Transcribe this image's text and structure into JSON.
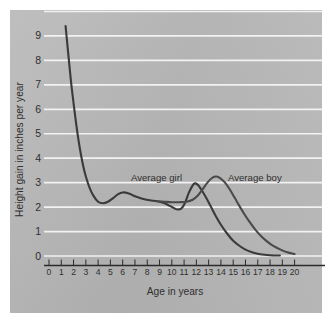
{
  "chart_data": {
    "type": "line",
    "title": "",
    "xlabel": "Age in years",
    "ylabel": "Height gain in inches per year",
    "xlim": [
      0,
      20
    ],
    "ylim": [
      0,
      10
    ],
    "grid": true,
    "grid_axis": "y",
    "legend_position": "inline-annotation",
    "xticks": [
      "0",
      "1",
      "2",
      "3",
      "4",
      "5",
      "6",
      "7",
      "8",
      "9",
      "10",
      "11",
      "12",
      "13",
      "14",
      "15",
      "16",
      "17",
      "18",
      "19",
      "20"
    ],
    "yticks": [
      "0",
      "1",
      "2",
      "3",
      "4",
      "5",
      "6",
      "7",
      "8",
      "9"
    ],
    "annotations": [
      {
        "text": "Average girl",
        "x": 9.0,
        "y": 3.35
      },
      {
        "text": "Average boy",
        "x": 16.9,
        "y": 3.35
      }
    ],
    "series": [
      {
        "name": "Average girl",
        "color": "#3a3a3a",
        "points": [
          [
            1.35,
            9.4
          ],
          [
            1.6,
            8.1
          ],
          [
            1.8,
            7.1
          ],
          [
            2.0,
            6.25
          ],
          [
            2.2,
            5.45
          ],
          [
            2.4,
            4.75
          ],
          [
            2.6,
            4.15
          ],
          [
            2.8,
            3.65
          ],
          [
            3.0,
            3.25
          ],
          [
            3.3,
            2.8
          ],
          [
            3.6,
            2.48
          ],
          [
            4.0,
            2.22
          ],
          [
            4.4,
            2.16
          ],
          [
            4.8,
            2.22
          ],
          [
            5.2,
            2.36
          ],
          [
            5.6,
            2.52
          ],
          [
            6.0,
            2.6
          ],
          [
            6.5,
            2.56
          ],
          [
            7.0,
            2.44
          ],
          [
            7.6,
            2.34
          ],
          [
            8.2,
            2.28
          ],
          [
            8.8,
            2.24
          ],
          [
            9.3,
            2.18
          ],
          [
            9.8,
            2.06
          ],
          [
            10.2,
            1.95
          ],
          [
            10.5,
            1.9
          ],
          [
            10.8,
            1.95
          ],
          [
            11.1,
            2.2
          ],
          [
            11.4,
            2.6
          ],
          [
            11.8,
            2.95
          ],
          [
            12.1,
            2.92
          ],
          [
            12.4,
            2.72
          ],
          [
            12.8,
            2.38
          ],
          [
            13.2,
            2.0
          ],
          [
            13.6,
            1.62
          ],
          [
            14.0,
            1.28
          ],
          [
            14.5,
            0.92
          ],
          [
            15.0,
            0.62
          ],
          [
            15.5,
            0.42
          ],
          [
            16.0,
            0.26
          ],
          [
            16.6,
            0.14
          ],
          [
            17.2,
            0.07
          ],
          [
            18.0,
            0.03
          ],
          [
            18.8,
            0.02
          ]
        ]
      },
      {
        "name": "Average boy",
        "color": "#4a4a4a",
        "points": [
          [
            8.8,
            2.24
          ],
          [
            9.4,
            2.22
          ],
          [
            10.0,
            2.2
          ],
          [
            10.6,
            2.2
          ],
          [
            11.2,
            2.22
          ],
          [
            11.7,
            2.3
          ],
          [
            12.1,
            2.46
          ],
          [
            12.5,
            2.72
          ],
          [
            12.9,
            3.0
          ],
          [
            13.3,
            3.2
          ],
          [
            13.6,
            3.25
          ],
          [
            13.9,
            3.2
          ],
          [
            14.3,
            3.02
          ],
          [
            14.7,
            2.74
          ],
          [
            15.1,
            2.4
          ],
          [
            15.5,
            2.05
          ],
          [
            15.9,
            1.72
          ],
          [
            16.3,
            1.42
          ],
          [
            16.8,
            1.08
          ],
          [
            17.3,
            0.8
          ],
          [
            17.8,
            0.58
          ],
          [
            18.3,
            0.4
          ],
          [
            18.9,
            0.25
          ],
          [
            19.4,
            0.15
          ],
          [
            20.0,
            0.08
          ]
        ]
      }
    ]
  },
  "axes": {
    "x_axis_label": "Age in years",
    "y_axis_label": "Height gain in inches per year"
  },
  "labels": {
    "girl": "Average girl",
    "boy": "Average boy"
  },
  "colors": {
    "panel_background": "#b9b9b9",
    "gridline": "#f2f2f2",
    "axis_line": "#2b2b2b",
    "tick_text": "#2f2f2f",
    "girl_curve": "#3a3a3a",
    "boy_curve": "#4a4a4a"
  }
}
